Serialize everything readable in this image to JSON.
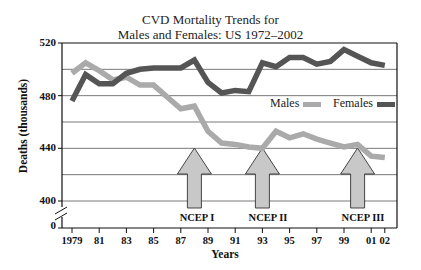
{
  "chart_data": {
    "type": "line",
    "title_lines": [
      "CVD Mortality Trends for",
      "Males and Females: US 1972–2002"
    ],
    "xlabel": "Years",
    "ylabel": "Deaths (thousands)",
    "ylim": [
      400,
      520
    ],
    "y_break": true,
    "y_ticks": [
      "520",
      "480",
      "440",
      "400",
      "0"
    ],
    "x_ticks": [
      "1979",
      "81",
      "83",
      "85",
      "87",
      "89",
      "91",
      "93",
      "95",
      "97",
      "99",
      "01",
      "02"
    ],
    "grid": true,
    "legend_position": "inside-right",
    "x": [
      1979,
      1980,
      1981,
      1982,
      1983,
      1984,
      1985,
      1986,
      1987,
      1988,
      1989,
      1990,
      1991,
      1992,
      1993,
      1994,
      1995,
      1996,
      1997,
      1998,
      1999,
      2000,
      2001,
      2002
    ],
    "series": [
      {
        "name": "Males",
        "color": "#aaaaaa",
        "values": [
          497,
          505,
          499,
          492,
          494,
          488,
          488,
          479,
          470,
          472,
          453,
          444,
          443,
          441,
          440,
          453,
          448,
          451,
          447,
          444,
          441,
          443,
          434,
          433
        ]
      },
      {
        "name": "Females",
        "color": "#555555",
        "values": [
          476,
          496,
          489,
          489,
          497,
          500,
          501,
          501,
          501,
          507,
          490,
          482,
          484,
          483,
          505,
          502,
          509,
          509,
          504,
          506,
          515,
          510,
          505,
          503
        ]
      }
    ],
    "annotations": [
      {
        "label": "NCEP I",
        "x": 1988,
        "type": "up-arrow"
      },
      {
        "label": "NCEP II",
        "x": 1993,
        "type": "up-arrow"
      },
      {
        "label": "NCEP III",
        "x": 2000,
        "type": "up-arrow"
      }
    ]
  }
}
